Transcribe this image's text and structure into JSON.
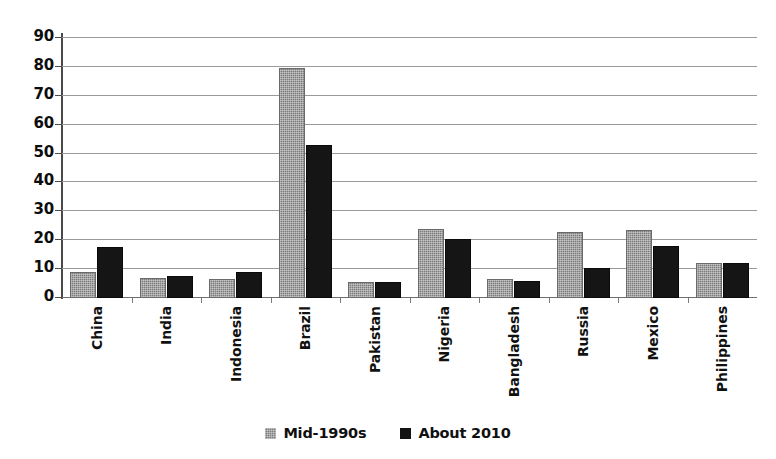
{
  "chart_data": {
    "type": "bar",
    "title": "",
    "subtitle": "",
    "xlabel": "",
    "ylabel": "",
    "ylim": [
      0,
      90
    ],
    "ytick_step": 10,
    "yticks": [
      90,
      80,
      70,
      60,
      50,
      40,
      30,
      20,
      10,
      0
    ],
    "grid": true,
    "legend_position": "bottom",
    "categories": [
      "China",
      "India",
      "Indonesia",
      "Brazil",
      "Pakistan",
      "Nigeria",
      "Bangladesh",
      "Russia",
      "Mexico",
      "Philippines"
    ],
    "series": [
      {
        "name": "Mid-1990s",
        "color": "#7d7d7d",
        "values": [
          9,
          7,
          6.5,
          79.5,
          5.5,
          24,
          6.5,
          23,
          23.5,
          12
        ]
      },
      {
        "name": "About 2010",
        "color": "#151515",
        "values": [
          17.5,
          7.5,
          9,
          53,
          5.5,
          20.5,
          6,
          10.5,
          18,
          12
        ]
      }
    ]
  },
  "legend": {
    "items": [
      {
        "label": "Mid-1990s",
        "swatch": "gray-dotted-square"
      },
      {
        "label": "About 2010",
        "swatch": "black-square"
      }
    ]
  }
}
